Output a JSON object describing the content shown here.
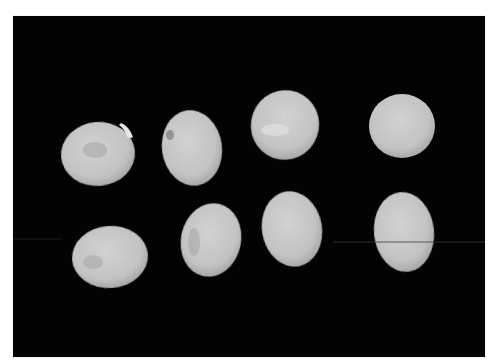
{
  "image": {
    "description": "Eight pale legume seeds arranged in two rows of four on a black background",
    "background_color": "#030303",
    "page_color": "#ffffff",
    "seed_color": "#c9c9c9",
    "seed_highlight": "#e2e2e2",
    "seed_shadow": "#8f8f8f",
    "rows": [
      {
        "name": "top-row",
        "seeds": [
          {
            "id": "seed-1",
            "cx": 85,
            "cy": 138,
            "rx": 37,
            "ry": 32,
            "rotate": -5
          },
          {
            "id": "seed-2",
            "cx": 179,
            "cy": 132,
            "rx": 30,
            "ry": 38,
            "rotate": -8
          },
          {
            "id": "seed-3",
            "cx": 272,
            "cy": 109,
            "rx": 34,
            "ry": 35,
            "rotate": 20
          },
          {
            "id": "seed-4",
            "cx": 389,
            "cy": 110,
            "rx": 33,
            "ry": 32,
            "rotate": 0
          }
        ]
      },
      {
        "name": "bottom-row",
        "seeds": [
          {
            "id": "seed-5",
            "cx": 97,
            "cy": 241,
            "rx": 38,
            "ry": 31,
            "rotate": -4
          },
          {
            "id": "seed-6",
            "cx": 198,
            "cy": 224,
            "rx": 30,
            "ry": 37,
            "rotate": 12
          },
          {
            "id": "seed-7",
            "cx": 279,
            "cy": 213,
            "rx": 30,
            "ry": 38,
            "rotate": -10
          },
          {
            "id": "seed-8",
            "cx": 391,
            "cy": 216,
            "rx": 30,
            "ry": 40,
            "rotate": -6
          }
        ]
      }
    ]
  }
}
